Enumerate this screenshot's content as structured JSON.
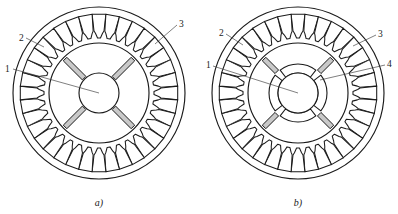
{
  "figure": {
    "background_color": "#ffffff",
    "line_color": "#1a1a1a",
    "magnet_fill_color": "#c9c9c9",
    "leader_color": "#3a3a3a"
  },
  "panels": [
    {
      "id": "panel-a",
      "caption": "a)",
      "caption_x": 99,
      "caption_y": 206,
      "center_x": 99,
      "center_y": 93,
      "stator_outer_radius": 86,
      "stator_slot_count": 36,
      "rotor_outer_radius": 50,
      "rotor_bore_radius": 20,
      "rotor_bore_type": "plain-circular-shaft-hole",
      "magnet_count": 4,
      "magnet_orientation_degrees": [
        45,
        135,
        225,
        315
      ],
      "magnet_inner_radius": 21,
      "magnet_outer_radius": 48,
      "magnet_width": 5,
      "has_inner_ring": false,
      "callouts": [
        {
          "label": "1",
          "text_x": 5,
          "text_y": 72,
          "line_from_x": 13,
          "line_from_y": 69,
          "line_to_x": 99,
          "line_to_y": 93
        },
        {
          "label": "2",
          "text_x": 19,
          "text_y": 41,
          "line_from_x": 26,
          "line_from_y": 38,
          "line_to_x": 44,
          "line_to_y": 47
        },
        {
          "label": "3",
          "text_x": 179,
          "text_y": 27,
          "line_from_x": 177,
          "line_from_y": 25,
          "line_to_x": 155,
          "line_to_y": 44
        }
      ]
    },
    {
      "id": "panel-b",
      "caption": "b)",
      "caption_x": 298,
      "caption_y": 206,
      "center_x": 298,
      "center_y": 93,
      "stator_outer_radius": 86,
      "stator_slot_count": 36,
      "rotor_outer_radius": 50,
      "rotor_bore_radius": 20,
      "rotor_bore_type": "ring-with-four-flux-barrier-gaps",
      "inner_ring_inner_radius": 20,
      "inner_ring_outer_radius": 29,
      "inner_ring_segment_count": 4,
      "inner_ring_gap_angles_degrees": [
        45,
        135,
        225,
        315
      ],
      "magnet_count": 4,
      "magnet_orientation_degrees": [
        45,
        135,
        225,
        315
      ],
      "magnet_inner_radius": 30,
      "magnet_outer_radius": 48,
      "magnet_width": 5,
      "has_inner_ring": true,
      "callouts": [
        {
          "label": "1",
          "text_x": 206,
          "text_y": 68,
          "line_from_x": 213,
          "line_from_y": 66,
          "line_to_x": 298,
          "line_to_y": 93
        },
        {
          "label": "2",
          "text_x": 219,
          "text_y": 36,
          "line_from_x": 226,
          "line_from_y": 34,
          "line_to_x": 243,
          "line_to_y": 45
        },
        {
          "label": "3",
          "text_x": 378,
          "text_y": 37,
          "line_from_x": 376,
          "line_from_y": 35,
          "line_to_x": 353,
          "line_to_y": 46
        },
        {
          "label": "4",
          "text_x": 387,
          "text_y": 67,
          "line_from_x": 385,
          "line_from_y": 65,
          "line_to_x": 320,
          "line_to_y": 80
        }
      ]
    }
  ],
  "legend_keys": [
    {
      "number": "1",
      "meaning": "rotor shaft bore"
    },
    {
      "number": "2",
      "meaning": "stator slot"
    },
    {
      "number": "3",
      "meaning": "stator tooth"
    },
    {
      "number": "4",
      "meaning": "rotor inner ring segment"
    }
  ]
}
